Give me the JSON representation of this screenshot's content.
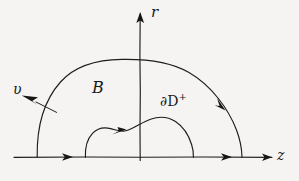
{
  "figure": {
    "background_color": "#f5f4f2",
    "ink_color": "#1a1a1a",
    "width": 299,
    "height": 181,
    "axes": {
      "horizontal": {
        "label": "z",
        "description": "real axis pointing right",
        "y": 157,
        "x_start": 14,
        "x_end": 272,
        "arrow_marks": 3
      },
      "vertical": {
        "label": "r",
        "description": "radial axis pointing up",
        "x": 140,
        "y_top": 12,
        "y_bottom": 160,
        "arrow_marks": 1
      }
    },
    "labels": {
      "region": "B",
      "normal_vector": "υ",
      "boundary_main": "∂D",
      "boundary_sup": "+",
      "axis_vertical": "r",
      "axis_horizontal": "z"
    },
    "curves": [
      {
        "name": "outer-semicircle",
        "description": "large semicircular arc bounding region B",
        "left_foot_x": 37,
        "right_foot_x": 242,
        "apex_y": 60,
        "orientation": "clockwise",
        "arrow_at": "right upper quadrant"
      },
      {
        "name": "inner-boundary",
        "description": "irregular hand-drawn inner boundary of D",
        "left_foot_x": 85,
        "right_foot_x": 193,
        "apex_y": 118,
        "orientation": "counterclockwise-positive",
        "arrow_at": "left upper portion"
      }
    ],
    "annotations": [
      {
        "name": "normal-arrow",
        "description": "outward unit normal arrow on outer arc",
        "from_x": 56,
        "from_y": 112,
        "to_x": 22,
        "to_y": 96
      }
    ]
  }
}
